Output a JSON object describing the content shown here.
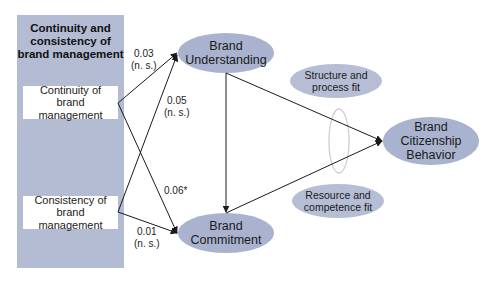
{
  "panel": {
    "title": "Continuity and consistency of brand management",
    "title_lines": [
      "Continuity and",
      "consistency of",
      "brand management"
    ],
    "boxes": [
      {
        "id": "continuity",
        "lines": [
          "Continuity of",
          "brand management"
        ]
      },
      {
        "id": "consistency",
        "lines": [
          "Consistency of",
          "brand management"
        ]
      }
    ],
    "fill_color": "#b3bcd3"
  },
  "nodes": {
    "brand_understanding": {
      "lines": [
        "Brand",
        "Understanding"
      ]
    },
    "brand_commitment": {
      "lines": [
        "Brand",
        "Commitment"
      ]
    },
    "brand_citizenship_behavior": {
      "lines": [
        "Brand",
        "Citizenship",
        "Behavior"
      ]
    },
    "structure_process_fit": {
      "lines": [
        "Structure and",
        "process fit"
      ]
    },
    "resource_competence_fit": {
      "lines": [
        "Resource and",
        "competence fit"
      ]
    }
  },
  "paths": [
    {
      "from": "Continuity of brand management",
      "to": "Brand Understanding",
      "coef": "0.03",
      "sig": "(n. s.)"
    },
    {
      "from": "Consistency of brand management",
      "to": "Brand Understanding",
      "coef": "0.05",
      "sig": "(n. s.)"
    },
    {
      "from": "Continuity of brand management",
      "to": "Brand Commitment",
      "coef": "0.06*",
      "sig": ""
    },
    {
      "from": "Consistency of brand management",
      "to": "Brand Commitment",
      "coef": "0.01",
      "sig": "(n. s.)"
    },
    {
      "from": "Brand Understanding",
      "to": "Brand Commitment",
      "coef": "",
      "sig": ""
    },
    {
      "from": "Brand Understanding",
      "to": "Brand Citizenship Behavior",
      "coef": "",
      "sig": ""
    },
    {
      "from": "Brand Commitment",
      "to": "Brand Citizenship Behavior",
      "coef": "",
      "sig": ""
    }
  ],
  "colors": {
    "ellipse_fill": "#a9b3cf",
    "panel_fill": "#b3bcd3",
    "line": "#1a1a1a",
    "moderator_ring": "#d0d0d0"
  }
}
